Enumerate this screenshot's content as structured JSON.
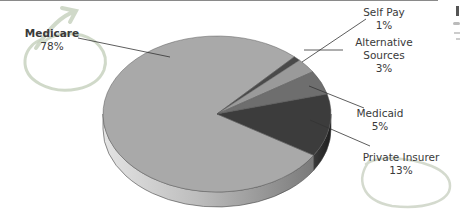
{
  "chart_data": {
    "type": "pie",
    "style": "3d",
    "title": "",
    "slices": [
      {
        "label": "Medicare",
        "value": 78,
        "display": "78%",
        "color": "#a9a9a9",
        "highlighted": true
      },
      {
        "label": "Self Pay",
        "value": 1,
        "display": "1%",
        "color": "#4a4a4a",
        "highlighted": false
      },
      {
        "label": "Alternative Sources",
        "value": 3,
        "display": "3%",
        "color": "#9a9a9a",
        "highlighted": false
      },
      {
        "label": "Medicaid",
        "value": 5,
        "display": "5%",
        "color": "#6e6e6e",
        "highlighted": false
      },
      {
        "label": "Private Insurer",
        "value": 13,
        "display": "13%",
        "color": "#3c3c3c",
        "highlighted": true
      }
    ],
    "label_lines": [
      [
        "Medicare",
        "78%"
      ],
      [
        "Self Pay",
        "1%"
      ],
      [
        "Alternative",
        "Sources",
        "3%"
      ],
      [
        "Medicaid",
        "5%"
      ],
      [
        "Private Insurer",
        "13%"
      ]
    ],
    "legend": "none",
    "annotations": [
      "hand-drawn circle around Medicare label",
      "hand-drawn circle around Private Insurer label"
    ]
  }
}
